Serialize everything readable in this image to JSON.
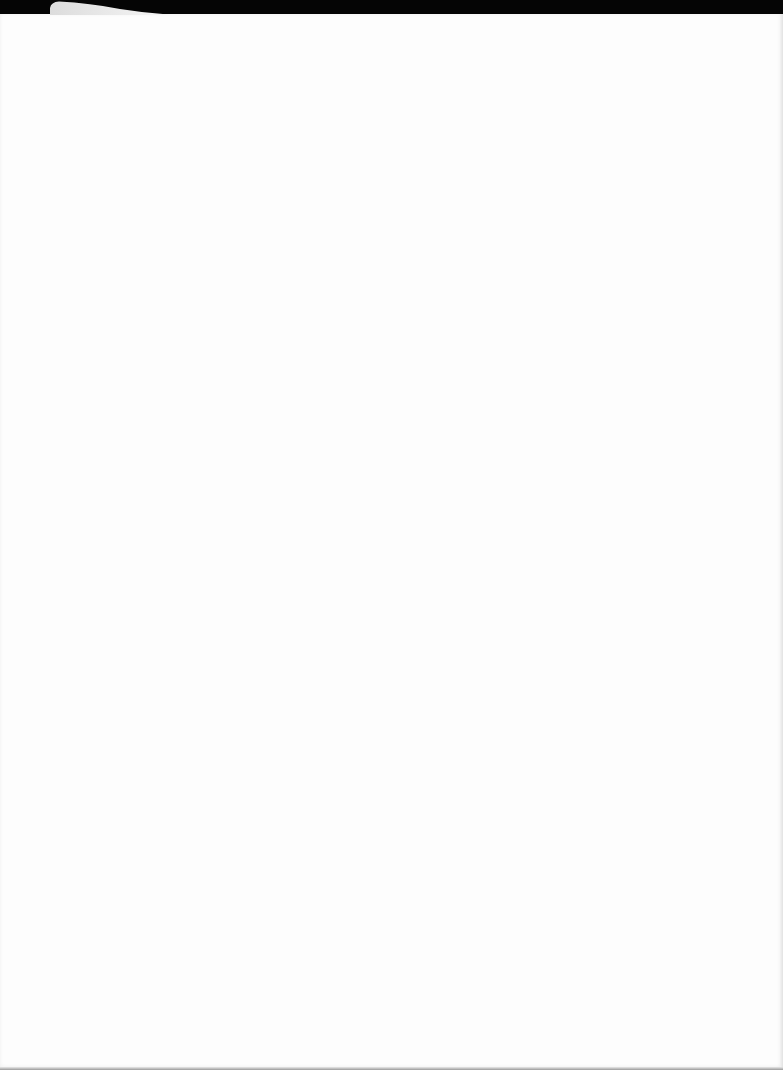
{
  "document": {
    "type": "blank-sheet",
    "content": "",
    "colors": {
      "background": "#050505",
      "paper": "#fdfdfd",
      "curl": "#e6e6e6",
      "edge": "#e2e2e2"
    }
  }
}
